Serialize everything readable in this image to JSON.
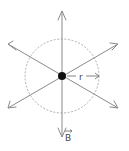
{
  "diagram": {
    "type": "radial-field-diagram",
    "center": {
      "x": 62,
      "y": 76
    },
    "charge": {
      "label": "",
      "radius": 4,
      "color": "#111111"
    },
    "circle": {
      "radius": 37,
      "style": "dashed",
      "color": "#9a9a9a"
    },
    "radius_label": "r",
    "field_label": "B",
    "field_label_vector": true,
    "field_lines": [
      {
        "name": "up",
        "tip": {
          "x": 62,
          "y": 11
        }
      },
      {
        "name": "down",
        "tip": {
          "x": 62,
          "y": 137
        }
      },
      {
        "name": "upper-left",
        "tip": {
          "x": 8,
          "y": 44
        }
      },
      {
        "name": "upper-right",
        "tip": {
          "x": 118,
          "y": 44
        }
      },
      {
        "name": "lower-left",
        "tip": {
          "x": 8,
          "y": 108
        }
      },
      {
        "name": "lower-right",
        "tip": {
          "x": 118,
          "y": 108
        }
      }
    ],
    "line_color": "#8a8a8a"
  }
}
